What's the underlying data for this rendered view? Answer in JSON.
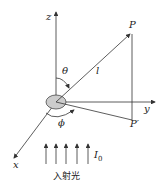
{
  "diagram": {
    "labels": {
      "z": "z",
      "y": "y",
      "x": "x",
      "P": "P",
      "P_prime": "P′",
      "theta": "θ",
      "phi": "ϕ",
      "l": "l",
      "I0_main": "I",
      "I0_sub": "0",
      "incident_light": "入射光"
    },
    "colors": {
      "line": "#333333",
      "scatterer_fill": "#cccccc"
    }
  }
}
